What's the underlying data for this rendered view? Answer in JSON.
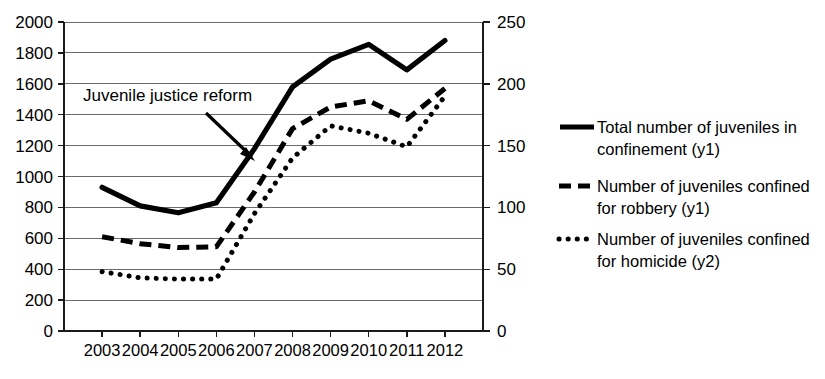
{
  "chart_data": {
    "type": "line",
    "title": "",
    "xlabel": "",
    "ylabel": "",
    "categories": [
      "2003",
      "2004",
      "2005",
      "2006",
      "2007",
      "2008",
      "2009",
      "2010",
      "2011",
      "2012"
    ],
    "grid": true,
    "legend_position": "right",
    "y_axes": [
      {
        "id": "y1",
        "side": "left",
        "ylim": [
          0,
          2000
        ],
        "tick_step": 200,
        "ticks": [
          "0",
          "200",
          "400",
          "600",
          "800",
          "1000",
          "1200",
          "1400",
          "1600",
          "1800",
          "2000"
        ]
      },
      {
        "id": "y2",
        "side": "right",
        "ylim": [
          0,
          250
        ],
        "tick_step": 50,
        "ticks": [
          "0",
          "50",
          "100",
          "150",
          "200",
          "250"
        ]
      }
    ],
    "series": [
      {
        "name": "Total number of juveniles in confinement (y1)",
        "axis": "y1",
        "style": "solid",
        "values": [
          930,
          810,
          765,
          830,
          1180,
          1580,
          1760,
          1855,
          1690,
          1880
        ]
      },
      {
        "name": "Number of juveniles confined for robbery (y1)",
        "axis": "y1",
        "style": "dashed",
        "values": [
          610,
          565,
          540,
          545,
          900,
          1310,
          1450,
          1490,
          1370,
          1570
        ]
      },
      {
        "name": "Number of juveniles confined for homicide (y2)",
        "axis": "y2",
        "style": "dotted",
        "values": [
          48,
          43,
          42,
          42,
          95,
          140,
          166,
          160,
          149,
          190
        ]
      }
    ],
    "annotations": [
      {
        "text": "Juvenile justice reform",
        "target_year": "2007",
        "target_value_y1": 1100
      }
    ]
  },
  "legend": {
    "items": [
      {
        "label_line1": "Total number of juveniles in",
        "label_line2": "confinement (y1)",
        "marker": "solid-line-marker"
      },
      {
        "label_line1": "Number of juveniles confined",
        "label_line2": "for robbery (y1)",
        "marker": "dashed-line-marker"
      },
      {
        "label_line1": "Number of juveniles confined",
        "label_line2": "for homicide (y2)",
        "marker": "dotted-line-marker"
      }
    ]
  },
  "colors": {
    "series": "#000000",
    "gridline": "#6b6b6b",
    "axis": "#1a1a1a",
    "background": "#ffffff"
  }
}
